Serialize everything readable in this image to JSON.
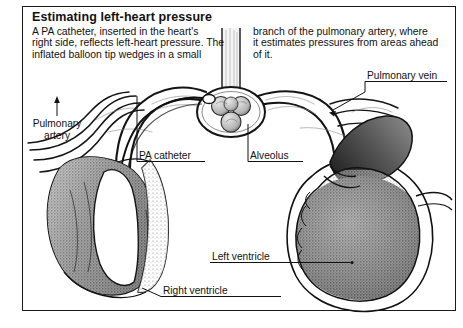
{
  "figure": {
    "title": "Estimating left-heart pressure",
    "body_left": "A PA catheter, inserted in the heart's\nright side, reflects left-heart pressure. The\ninflated balloon tip wedges in a small",
    "body_right": "branch of the pulmonary artery, where\nit estimates pressures from areas ahead\nof it.",
    "illustration_style": "pen-and-ink stipple anatomical cross-section",
    "border_color": "#1a1a1a",
    "ink_color": "#111111",
    "background": "#ffffff"
  },
  "labels": {
    "pulmonary_artery": "Pulmonary\nartery",
    "pa_catheter": "PA catheter",
    "alveolus": "Alveolus",
    "pulmonary_vein": "Pulmonary vein",
    "left_ventricle": "Left ventricle",
    "right_ventricle": "Right ventricle"
  },
  "anatomy": {
    "parts": [
      "right ventricle",
      "left ventricle",
      "pulmonary artery",
      "pulmonary vein",
      "alveolus",
      "bronchiole",
      "capillary bed",
      "PA catheter",
      "inflated balloon tip"
    ]
  }
}
